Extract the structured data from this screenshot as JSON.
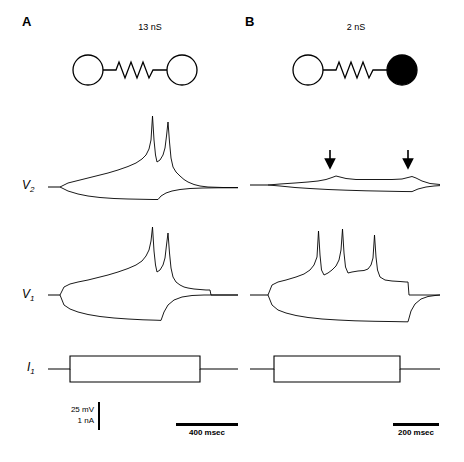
{
  "figure": {
    "panels": [
      {
        "letter": "A",
        "letter_pos": {
          "x": 22,
          "y": 22
        },
        "conductance_label": "13 nS",
        "conductance_pos": {
          "x": 150,
          "y": 28
        },
        "schematic": {
          "type": "two-cells-resistor",
          "filled_right": false
        },
        "time_bar": {
          "label": "400 msec",
          "x": 176,
          "y": 425,
          "width": 62
        }
      },
      {
        "letter": "B",
        "letter_pos": {
          "x": 245,
          "y": 22
        },
        "conductance_label": "2 nS",
        "conductance_pos": {
          "x": 355,
          "y": 28
        },
        "schematic": {
          "type": "two-cells-resistor",
          "filled_right": true
        },
        "time_bar": {
          "label": "200 msec",
          "x": 393,
          "y": 425,
          "width": 46
        }
      }
    ],
    "row_labels": [
      {
        "text": "V",
        "sub": "2",
        "x": 22,
        "y": 186
      },
      {
        "text": "V",
        "sub": "1",
        "x": 22,
        "y": 295
      },
      {
        "text": "I",
        "sub": "1",
        "x": 26,
        "y": 368
      }
    ],
    "scale_bar": {
      "voltage": "25 mV",
      "current": "1 nA",
      "x": 57,
      "y": 407
    },
    "arrows": [
      {
        "x": 333,
        "y": 158
      },
      {
        "x": 409,
        "y": 158
      }
    ],
    "colors": {
      "ink": "#000000",
      "background": "#ffffff"
    }
  }
}
